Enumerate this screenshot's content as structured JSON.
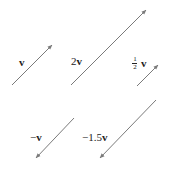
{
  "diagram": {
    "title": "",
    "stroke_color": "#7a7a7a",
    "label_color": "#222222",
    "vectors": [
      {
        "id": "v",
        "label": "v",
        "coefficient": "1",
        "from": [
          12,
          85
        ],
        "to": [
          52,
          45
        ]
      },
      {
        "id": "2v",
        "label_prefix": "2",
        "label": "v",
        "coefficient": "2",
        "from": [
          71,
          85
        ],
        "to": [
          146,
          10
        ]
      },
      {
        "id": "half_v",
        "label_num": "1",
        "label_den": "2",
        "label": "v",
        "coefficient": "1/2",
        "from": [
          137,
          86
        ],
        "to": [
          158,
          65
        ]
      },
      {
        "id": "neg_v",
        "label_prefix": "−",
        "label": "v",
        "coefficient": "-1",
        "from": [
          74,
          118
        ],
        "to": [
          36,
          158
        ]
      },
      {
        "id": "neg_1_5v",
        "label_prefix": "−1.5",
        "label": "v",
        "coefficient": "-1.5",
        "from": [
          156,
          100
        ],
        "to": [
          100,
          158
        ]
      }
    ]
  }
}
